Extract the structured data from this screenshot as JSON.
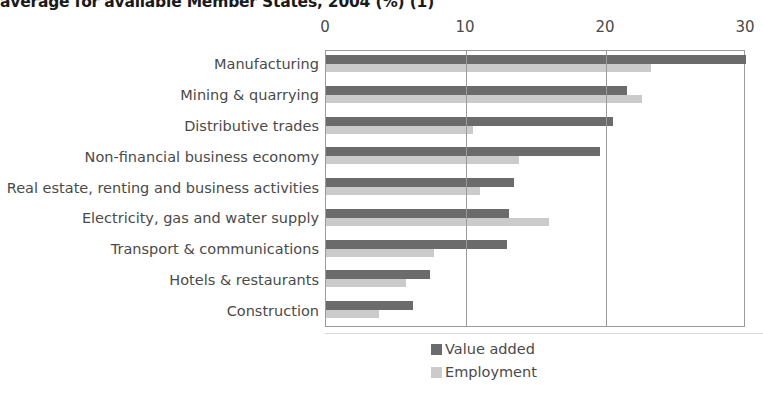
{
  "chart_data": {
    "type": "bar",
    "orientation": "horizontal",
    "title": "average for available Member States, 2004 (%) (1)",
    "xlabel": "",
    "ylabel": "",
    "xlim": [
      0,
      30
    ],
    "xticks": [
      0,
      10,
      20,
      30
    ],
    "grid": true,
    "legend_position": "bottom",
    "categories": [
      "Manufacturing",
      "Mining & quarrying",
      "Distributive trades",
      "Non-financial business economy",
      "Real estate, renting and business activities",
      "Electricity, gas and water supply",
      "Transport & communications",
      "Hotels & restaurants",
      "Construction"
    ],
    "series": [
      {
        "name": "Value added",
        "color": "#6b6b6b",
        "values": [
          30.0,
          21.5,
          20.5,
          19.6,
          13.4,
          13.1,
          12.9,
          7.4,
          6.2
        ]
      },
      {
        "name": "Employment",
        "color": "#cbcbcb",
        "values": [
          23.2,
          22.6,
          10.5,
          13.8,
          11.0,
          15.9,
          7.7,
          5.7,
          3.8
        ]
      }
    ]
  }
}
